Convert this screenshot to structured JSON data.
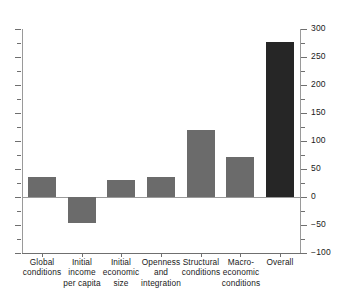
{
  "chart_data": {
    "type": "bar",
    "title": "",
    "subtitle": "",
    "xlabel": "",
    "ylabel": "",
    "ylim": [
      -100,
      300
    ],
    "y_ticks_major": [
      300,
      250,
      200,
      150,
      100,
      50,
      0,
      -50,
      -100
    ],
    "y_tick_labels": [
      "300",
      "250",
      "200",
      "150",
      "100",
      "50",
      "0",
      "−50",
      "−100"
    ],
    "y_ticks_minor_step": 25,
    "y_axis_position": "right",
    "left_axis_ticks_unlabeled": true,
    "grid": false,
    "legend": "none",
    "zero_line": 0,
    "categories": [
      "Global\nconditions",
      "Initial income\nper capita",
      "Initial\neconomic\nsize",
      "Openness\nand\nintegration",
      "Structural\nconditions",
      "Macro-\neconomic\nconditions",
      "Overall"
    ],
    "values": [
      36,
      -46,
      30,
      36,
      120,
      71,
      277
    ],
    "bar_colors": [
      "#6b6b6b",
      "#6b6b6b",
      "#6b6b6b",
      "#6b6b6b",
      "#6b6b6b",
      "#6b6b6b",
      "#262626"
    ],
    "colors": {
      "bar_default": "#6b6b6b",
      "bar_highlight": "#262626",
      "axis": "#6f6f6f",
      "zero_line": "#9a9a9a",
      "background": "#ffffff",
      "text": "#1a1a1a"
    }
  }
}
